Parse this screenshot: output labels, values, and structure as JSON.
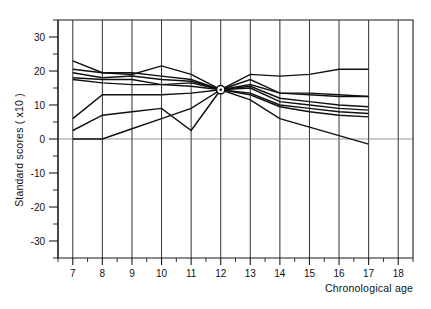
{
  "chart_data": {
    "type": "line",
    "title": "",
    "xlabel": "Chronological age",
    "ylabel": "Standard scores ( x10 )",
    "xlim": [
      6.5,
      18.5
    ],
    "ylim": [
      -35,
      35
    ],
    "xticks": [
      7,
      8,
      9,
      10,
      11,
      12,
      13,
      14,
      15,
      16,
      17,
      18
    ],
    "xtick_labels": [
      "7",
      "8",
      "9",
      "10",
      "11",
      "12",
      "13",
      "14",
      "15",
      "16",
      "17",
      "18"
    ],
    "yticks": [
      30,
      20,
      10,
      0,
      -10,
      -20,
      -30
    ],
    "ytick_labels": [
      "30",
      "20",
      "10",
      "0",
      "-10",
      "-20",
      "-30"
    ],
    "yticks_minor": [
      35,
      25,
      15,
      5,
      -5,
      -15,
      -25,
      -35
    ],
    "grid": "vertical-only",
    "legend": "none",
    "x": [
      7,
      8,
      9,
      10,
      11,
      12,
      13,
      14,
      15,
      16,
      17
    ],
    "convergence_point": {
      "x": 12,
      "y": 14.5,
      "marker": "circle-dot"
    },
    "series": [
      {
        "name": "series-1",
        "values": [
          23.0,
          19.5,
          19.0,
          21.5,
          19.0,
          14.5,
          19.0,
          18.5,
          19.0,
          20.5,
          20.5
        ]
      },
      {
        "name": "series-2",
        "values": [
          20.5,
          19.5,
          19.5,
          18.5,
          17.5,
          14.5,
          16.0,
          13.5,
          13.0,
          12.5,
          12.5
        ]
      },
      {
        "name": "series-3",
        "values": [
          19.5,
          18.0,
          18.5,
          17.5,
          17.0,
          14.5,
          15.5,
          12.0,
          11.0,
          10.0,
          9.5
        ]
      },
      {
        "name": "series-4",
        "values": [
          18.0,
          17.5,
          17.5,
          16.0,
          16.5,
          14.5,
          15.0,
          11.0,
          10.0,
          9.0,
          8.5
        ]
      },
      {
        "name": "series-5",
        "values": [
          17.5,
          16.5,
          16.0,
          16.0,
          15.5,
          14.5,
          13.5,
          10.0,
          9.0,
          8.0,
          7.5
        ]
      },
      {
        "name": "series-6",
        "values": [
          6.0,
          13.0,
          13.0,
          13.0,
          13.5,
          14.5,
          13.0,
          9.5,
          8.0,
          7.0,
          6.5
        ]
      },
      {
        "name": "series-7",
        "values": [
          2.5,
          7.0,
          8.0,
          9.0,
          2.5,
          14.5,
          17.5,
          13.5,
          13.5,
          13.0,
          12.5
        ]
      },
      {
        "name": "series-8",
        "values": [
          0.0,
          0.0,
          3.0,
          6.0,
          9.0,
          14.5,
          11.5,
          6.0,
          3.5,
          1.0,
          -1.5
        ]
      }
    ]
  },
  "axes": {
    "y_title": "Standard scores ( x10 )",
    "x_title": "Chronological age"
  },
  "tick_text": {
    "y": [
      "30",
      "20",
      "10",
      "0",
      "-10",
      "-20",
      "-30"
    ],
    "x": [
      "7",
      "8",
      "9",
      "10",
      "11",
      "12",
      "13",
      "14",
      "15",
      "16",
      "17",
      "18"
    ]
  }
}
